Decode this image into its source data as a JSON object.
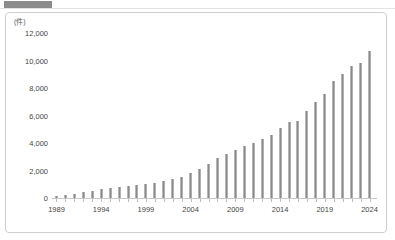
{
  "chart_data": {
    "type": "bar",
    "title": "",
    "subtitle": "",
    "unit_label": "(件)",
    "xlabel": "",
    "ylabel": "",
    "grid": false,
    "legend": null,
    "ylim": [
      0,
      12000
    ],
    "ytick_labels": [
      "12,000",
      "10,000",
      "8,000",
      "6,000",
      "4,000",
      "2,000",
      "0"
    ],
    "ytick_values": [
      12000,
      10000,
      8000,
      6000,
      4000,
      2000,
      0
    ],
    "xtick_labels": [
      "1989",
      "1994",
      "1999",
      "2004",
      "2009",
      "2014",
      "2019",
      "2024"
    ],
    "xtick_values": [
      1989,
      1994,
      1999,
      2004,
      2009,
      2014,
      2019,
      2024
    ],
    "categories": [
      "1989",
      "1990",
      "1991",
      "1992",
      "1993",
      "1994",
      "1995",
      "1996",
      "1997",
      "1998",
      "1999",
      "2000",
      "2001",
      "2002",
      "2003",
      "2004",
      "2005",
      "2006",
      "2007",
      "2008",
      "2009",
      "2010",
      "2011",
      "2012",
      "2013",
      "2014",
      "2015",
      "2016",
      "2017",
      "2018",
      "2019",
      "2020",
      "2021",
      "2022",
      "2023",
      "2024"
    ],
    "values": [
      120,
      200,
      300,
      420,
      520,
      640,
      700,
      800,
      900,
      950,
      1000,
      1100,
      1250,
      1400,
      1550,
      1800,
      2100,
      2500,
      2900,
      3200,
      3500,
      3800,
      4000,
      4300,
      4600,
      5100,
      5500,
      5600,
      6300,
      7000,
      7600,
      8500,
      9000,
      9600,
      9800,
      10700
    ],
    "bar_color": "#8a8a8a",
    "background_color": "#ffffff",
    "border_color": "#cfcfcf"
  },
  "window": {
    "top_bar_color": "#8c8c8c"
  }
}
